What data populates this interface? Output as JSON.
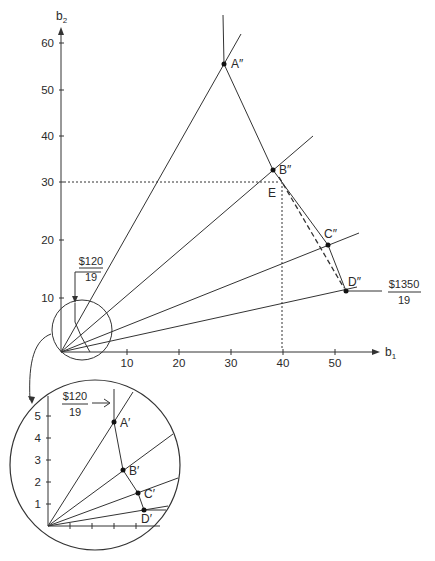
{
  "main": {
    "y_axis_label": "b",
    "y_axis_sub": "2",
    "x_axis_label": "b",
    "x_axis_sub": "1",
    "y_ticks": [
      "60",
      "50",
      "40",
      "30",
      "20",
      "10"
    ],
    "x_ticks": [
      "10",
      "20",
      "30",
      "40",
      "50"
    ],
    "points": {
      "a": "A″",
      "b": "B″",
      "c": "C″",
      "d": "D″",
      "e": "E"
    },
    "budget_low_num": "$120",
    "budget_low_den": "19",
    "budget_high_num": "$1350",
    "budget_high_den": "19"
  },
  "inset": {
    "y_ticks": [
      "5",
      "4",
      "3",
      "2",
      "1"
    ],
    "points": {
      "a": "A′",
      "b": "B′",
      "c": "C′",
      "d": "D′"
    },
    "budget_num": "$120",
    "budget_den": "19"
  },
  "colors": {
    "line": "#333333",
    "text": "#2a2a2a"
  }
}
